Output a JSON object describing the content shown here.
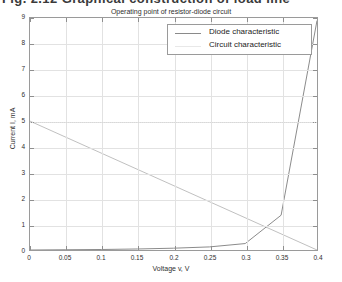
{
  "document_text": {
    "clipped_heading": "Fig. 2.12   Graphical construction of load line"
  },
  "chart_data": {
    "type": "line",
    "title": "Operating point of resistor-diode circuit",
    "xlabel": "Voltage v, V",
    "ylabel": "Current I, mA",
    "xlim": [
      0,
      0.4
    ],
    "ylim": [
      0,
      9
    ],
    "xticks": [
      "0",
      "0.05",
      "0.1",
      "0.15",
      "0.2",
      "0.25",
      "0.3",
      "0.35",
      "0.4"
    ],
    "xtick_values": [
      0,
      0.05,
      0.1,
      0.15,
      0.2,
      0.25,
      0.3,
      0.35,
      0.4
    ],
    "yticks": [
      "0",
      "1",
      "2",
      "3",
      "4",
      "5",
      "6",
      "7",
      "8",
      "9"
    ],
    "ytick_values": [
      0,
      1,
      2,
      3,
      4,
      5,
      6,
      7,
      8,
      9
    ],
    "grid": true,
    "legend_position": "upper right",
    "series": [
      {
        "name": "Diode characteristic",
        "color": "#8a8a8a",
        "x": [
          0,
          0.05,
          0.1,
          0.15,
          0.2,
          0.25,
          0.3,
          0.35,
          0.4
        ],
        "y": [
          0,
          0.01,
          0.02,
          0.04,
          0.07,
          0.12,
          0.25,
          1.35,
          8.9
        ]
      },
      {
        "name": "Circuit characteristic",
        "color": "#bfbfbf",
        "x": [
          0,
          0.4
        ],
        "y": [
          5.0,
          0.0
        ]
      }
    ],
    "annotations": [
      {
        "type": "hline",
        "y": 5.0,
        "style": "dotted",
        "color": "#d8d8d8"
      }
    ]
  },
  "legend": {
    "entries": [
      {
        "label": "Diode characteristic"
      },
      {
        "label": "Circuit characteristic"
      }
    ]
  }
}
